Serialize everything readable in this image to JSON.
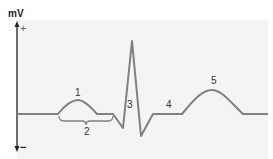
{
  "diagram": {
    "axis": {
      "unit_label": "mV",
      "positive_label": "+",
      "negative_label": "−"
    },
    "labels": [
      {
        "id": "1",
        "text": "1",
        "x": 78,
        "y": 96
      },
      {
        "id": "2",
        "text": "2",
        "x": 87,
        "y": 134
      },
      {
        "id": "3",
        "text": "3",
        "x": 131,
        "y": 107
      },
      {
        "id": "4",
        "text": "4",
        "x": 169,
        "y": 107
      },
      {
        "id": "5",
        "text": "5",
        "x": 214,
        "y": 83
      }
    ],
    "colors": {
      "panel": "#f4f4f4",
      "waveform": "#808080",
      "axis": "#222222",
      "text": "#333333"
    }
  }
}
